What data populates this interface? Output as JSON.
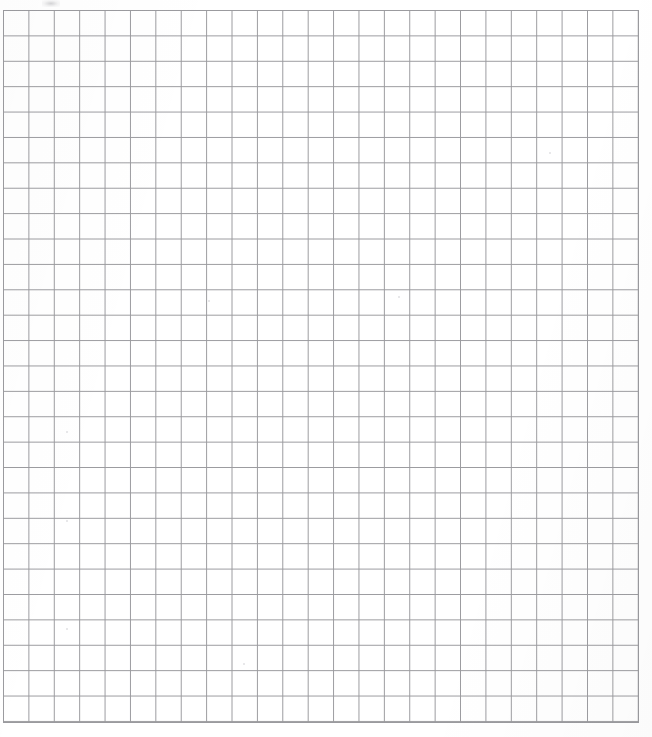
{
  "document": {
    "kind": "grid-paper-scan",
    "title": "Blank graph paper sheet",
    "content_text": "",
    "background_color": "#ffffff",
    "page_width_px": 652,
    "page_height_px": 737
  },
  "grid": {
    "line_color": "#9a9a9e",
    "line_width_px": 1,
    "cell_width_px": 25.4,
    "cell_height_px": 25.4,
    "columns": 25,
    "rows": 28,
    "left_px": 3,
    "top_px": 10,
    "right_px": 638,
    "bottom_px": 722,
    "width_px": 635,
    "height_px": 712,
    "major_lines": false
  },
  "artifacts": {
    "top_smudge": {
      "x": 42,
      "y": 0,
      "width": 18,
      "height": 7
    },
    "specks": [
      {
        "x": 208,
        "y": 300,
        "size": 2
      },
      {
        "x": 398,
        "y": 296,
        "size": 2
      },
      {
        "x": 66,
        "y": 431,
        "size": 2
      },
      {
        "x": 66,
        "y": 520,
        "size": 2
      },
      {
        "x": 66,
        "y": 628,
        "size": 2
      },
      {
        "x": 243,
        "y": 663,
        "size": 2
      },
      {
        "x": 549,
        "y": 152,
        "size": 2
      }
    ]
  },
  "labels": {
    "page_description": "Blank ruled grid (graph) paper, 25 columns by 28 rows",
    "content_placeholder": ""
  }
}
